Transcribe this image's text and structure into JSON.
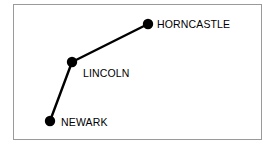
{
  "diagram": {
    "frame": {
      "border_color": "#9a9a9a",
      "background_color": "#ffffff"
    },
    "style": {
      "line_color": "#000000",
      "node_color": "#000000",
      "label_color": "#000000",
      "line_width": 2.4,
      "node_radius": 5.2
    },
    "nodes": [
      {
        "id": "horncastle",
        "label": "HORNCASTLE",
        "x": 148,
        "y": 24
      },
      {
        "id": "lincoln",
        "label": "LINCOLN",
        "x": 72,
        "y": 62
      },
      {
        "id": "newark",
        "label": "NEWARK",
        "x": 50,
        "y": 121
      }
    ],
    "edges": [
      {
        "from": "lincoln",
        "to": "horncastle"
      },
      {
        "from": "newark",
        "to": "lincoln"
      }
    ]
  }
}
